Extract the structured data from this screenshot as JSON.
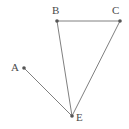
{
  "figure": {
    "width": 129,
    "height": 129,
    "background_color": "#ffffff",
    "stroke_color": "#808080",
    "vertex_dot_color": "#555555",
    "label_color": "#4a4a4a",
    "stroke_width": 1,
    "vertex_dot_radius": 1.8,
    "points": [
      {
        "name": "A",
        "label": "A",
        "x": 24,
        "y": 68,
        "label_x": 11,
        "label_y": 62
      },
      {
        "name": "B",
        "label": "B",
        "x": 57,
        "y": 21,
        "label_x": 52,
        "label_y": 5
      },
      {
        "name": "C",
        "label": "C",
        "x": 120,
        "y": 21,
        "label_x": 112,
        "label_y": 5
      },
      {
        "name": "E",
        "label": "E",
        "x": 72,
        "y": 116,
        "label_x": 76,
        "label_y": 112
      }
    ],
    "segments": [
      {
        "name": "segment-BC",
        "from": "B",
        "to": "C",
        "x1": 57,
        "y1": 21,
        "x2": 120,
        "y2": 21
      },
      {
        "name": "segment-BE",
        "from": "B",
        "to": "E",
        "x1": 57,
        "y1": 21,
        "x2": 72,
        "y2": 116
      },
      {
        "name": "segment-CE",
        "from": "C",
        "to": "E",
        "x1": 120,
        "y1": 21,
        "x2": 72,
        "y2": 116
      },
      {
        "name": "segment-AE",
        "from": "A",
        "to": "E",
        "x1": 24,
        "y1": 68,
        "x2": 72,
        "y2": 116
      }
    ]
  }
}
